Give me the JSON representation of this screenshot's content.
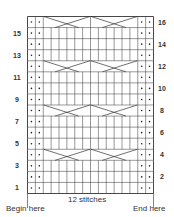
{
  "chart": {
    "columns": 16,
    "rows": 16,
    "purl_columns": [
      1,
      2,
      15,
      16
    ],
    "cable_rows": [
      4,
      8,
      12,
      16
    ],
    "cables": [
      {
        "start_col": 3,
        "width": 6,
        "type": "6-stitch cross"
      },
      {
        "start_col": 9,
        "width": 6,
        "type": "6-stitch cross"
      }
    ],
    "line_color": "#333333",
    "purl_symbol": "•"
  },
  "labels": {
    "left_rows": [
      "15",
      "13",
      "11",
      "9",
      "7",
      "5",
      "3",
      "1"
    ],
    "right_rows": [
      "16",
      "14",
      "12",
      "10",
      "8",
      "6",
      "4",
      "2"
    ],
    "repeat": "12 stitches",
    "begin": "Begin here",
    "end": "End here"
  }
}
